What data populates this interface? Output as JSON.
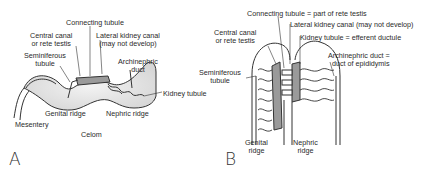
{
  "figure_a": {
    "panel_label": "A",
    "labels": {
      "connecting_tubule": "Connecting tubule",
      "central_canal_1": "Central canal",
      "central_canal_2": "or rete testis",
      "lateral_kidney_1": "Lateral kidney canal",
      "lateral_kidney_2": "(may not develop)",
      "seminiferous_1": "Seminiferous",
      "seminiferous_2": "tubule",
      "archinephric_1": "Archinephric",
      "archinephric_2": "duct",
      "kidney_tubule": "Kidney tubule",
      "genital_ridge": "Genital ridge",
      "nephric_ridge": "Nephric ridge",
      "mesentery": "Mesentery",
      "celom": "Celom"
    }
  },
  "figure_b": {
    "panel_label": "B",
    "labels": {
      "connecting_tubule": "Connecting tubule = part of rete testis",
      "lateral_kidney": "Lateral kidney canal (may not develop)",
      "central_canal_1": "Central canal",
      "central_canal_2": "or rete testis",
      "kidney_tubule": "Kidney tubule = efferent ductule",
      "archinephric_1": "Archinephric duct =",
      "archinephric_2": "duct of epididymis",
      "seminiferous_1": "Seminiferous",
      "seminiferous_2": "tubule",
      "genital_ridge_1": "Genital",
      "genital_ridge_2": "ridge",
      "nephric_ridge_1": "Nephric",
      "nephric_ridge_2": "ridge"
    }
  }
}
